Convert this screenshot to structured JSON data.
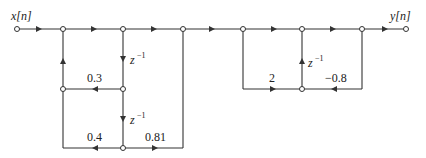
{
  "diagram": {
    "type": "signal-flow-graph",
    "input_label": "x[n]",
    "output_label": "y[n]",
    "section1": {
      "feedback_coeffs": [
        "0.3",
        "0.4"
      ],
      "feedforward_coeffs": [
        "0.81"
      ],
      "delays": [
        "z⁻¹",
        "z⁻¹"
      ]
    },
    "section2": {
      "feedforward_coeffs": [
        "2"
      ],
      "feedback_coeffs": [
        "−0.8"
      ],
      "delays": [
        "z⁻¹"
      ]
    },
    "labels": {
      "coef_03": "0.3",
      "coef_04": "0.4",
      "coef_081": "0.81",
      "coef_2": "2",
      "coef_m08": "−0.8",
      "delay_base": "z",
      "delay_exp": "−1"
    },
    "colors": {
      "line": "#333333",
      "node_fill": "#ffffff"
    }
  }
}
